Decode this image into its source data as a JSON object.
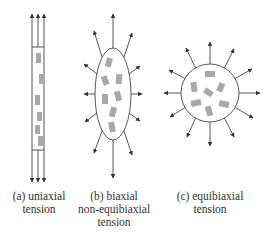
{
  "figure": {
    "panels": [
      {
        "id": "a",
        "label_lines": [
          "(a) uniaxial",
          "tension"
        ],
        "shape": "strip",
        "arrow_directions": [
          "up",
          "down"
        ]
      },
      {
        "id": "b",
        "label_lines": [
          "(b) biaxial",
          "non-equibiaxial",
          "tension"
        ],
        "shape": "ellipse",
        "arrow_directions": "radial (elongated vertically)"
      },
      {
        "id": "c",
        "label_lines": [
          "(c) equibiaxial",
          "tension"
        ],
        "shape": "circle",
        "arrow_directions": "radial (12 uniform)"
      }
    ]
  },
  "colors": {
    "line": "#444444",
    "block": "#a8a8a8",
    "text": "#333333",
    "background": "#ffffff"
  }
}
